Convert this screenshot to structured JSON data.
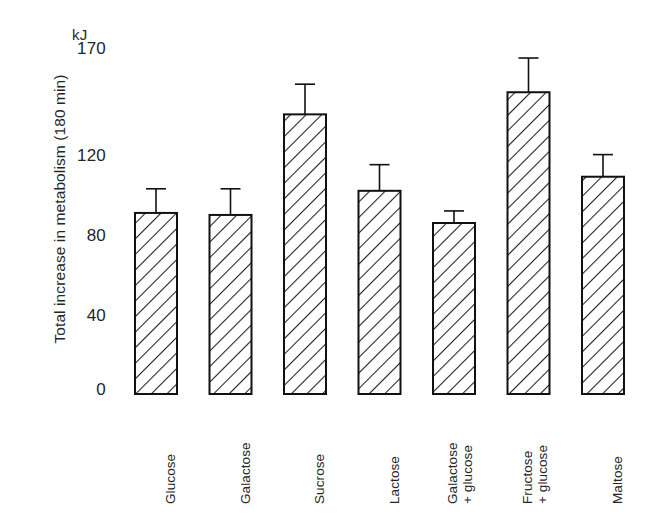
{
  "chart_data": {
    "type": "bar",
    "title": "",
    "xlabel": "",
    "ylabel": "Total increase in metabolism (180 min)",
    "unit_label": "kJ",
    "ylim": [
      0,
      170
    ],
    "yticks": [
      0,
      40,
      80,
      120,
      170
    ],
    "grid": false,
    "legend": "none",
    "categories": [
      "Glucose",
      "Galactose",
      "Sucrose",
      "Lactose",
      "Galactose + glucose",
      "Fructose + glucose",
      "Maltose"
    ],
    "category_lines": [
      [
        "Glucose",
        ""
      ],
      [
        "Galactose",
        ""
      ],
      [
        "Sucrose",
        ""
      ],
      [
        "Lactose",
        ""
      ],
      [
        "Galactose",
        "+ glucose"
      ],
      [
        "Fructose",
        "+ glucose"
      ],
      [
        "Maltose",
        ""
      ]
    ],
    "values": [
      90,
      89,
      139,
      101,
      85,
      150,
      108
    ],
    "errors_upper": [
      102,
      102,
      154,
      114,
      91,
      167,
      119
    ],
    "series": [
      {
        "name": "Total increase in metabolism (180 min)",
        "values": [
          90,
          89,
          139,
          101,
          85,
          150,
          108
        ]
      }
    ],
    "bar_style": {
      "fill": "diagonal-hatch",
      "hatch_color": "#1a1a1a",
      "edge_color": "#111111",
      "background": "#ffffff"
    }
  },
  "axis": {
    "unit": "kJ",
    "tick_labels": [
      "170",
      "120",
      "80",
      "40",
      "0"
    ],
    "y_title": "Total increase in metabolism (180 min)"
  }
}
